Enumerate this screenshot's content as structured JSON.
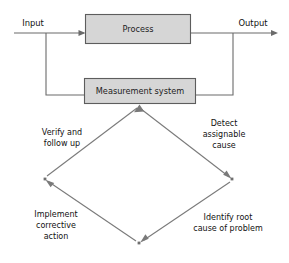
{
  "diagram": {
    "colors": {
      "box_fill": "#d6d6d6",
      "box_stroke": "#5d5d5d",
      "flow_stroke": "#6b6b6b",
      "cycle_stroke": "#7a7a7a",
      "text": "#111111",
      "background": "#ffffff"
    },
    "io": {
      "input_label": "Input",
      "output_label": "Output"
    },
    "boxes": [
      {
        "id": "process",
        "label": "Process"
      },
      {
        "id": "measurement",
        "label": "Measurement system"
      }
    ],
    "cycle": {
      "direction": "clockwise",
      "steps": [
        {
          "id": "detect",
          "position": "top-right",
          "lines": [
            "Detect",
            "assignable",
            "cause"
          ]
        },
        {
          "id": "identify",
          "position": "bottom-right",
          "lines": [
            "Identify root",
            "cause of problem"
          ]
        },
        {
          "id": "implement",
          "position": "bottom-left",
          "lines": [
            "Implement",
            "corrective",
            "action"
          ]
        },
        {
          "id": "verify",
          "position": "top-left",
          "lines": [
            "Verify and",
            "follow up"
          ]
        }
      ]
    }
  }
}
